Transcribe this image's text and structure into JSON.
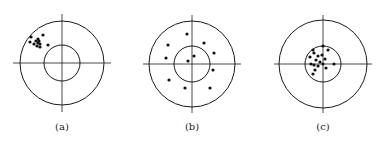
{
  "figure": {
    "stroke_color": "#1a1a1a",
    "dot_color": "#111111",
    "panels": [
      {
        "label": "(a)",
        "center": [
          62,
          63
        ],
        "outer_radius": 42,
        "inner_radius": 18,
        "cross_extent": 49,
        "dots": [
          [
            31,
            37
          ],
          [
            43,
            35
          ],
          [
            30,
            42
          ],
          [
            36,
            41
          ],
          [
            38,
            43
          ],
          [
            40,
            44
          ],
          [
            38,
            39
          ],
          [
            40,
            47
          ],
          [
            48,
            45
          ],
          [
            34,
            44
          ],
          [
            37,
            46
          ],
          [
            39,
            41
          ]
        ]
      },
      {
        "label": "(b)",
        "center": [
          192,
          64
        ],
        "outer_radius": 43,
        "inner_radius": 18,
        "cross_extent": 49,
        "dots": [
          [
            187,
            34
          ],
          [
            168,
            45
          ],
          [
            204,
            43
          ],
          [
            166,
            58
          ],
          [
            214,
            53
          ],
          [
            194,
            56
          ],
          [
            188,
            61
          ],
          [
            213,
            70
          ],
          [
            169,
            80
          ],
          [
            185,
            88
          ],
          [
            210,
            88
          ]
        ]
      },
      {
        "label": "(c)",
        "center": [
          323,
          64
        ],
        "outer_radius": 44,
        "inner_radius": 18,
        "cross_extent": 49,
        "dots": [
          [
            323,
            46
          ],
          [
            328,
            50
          ],
          [
            313,
            50
          ],
          [
            314,
            53
          ],
          [
            318,
            56
          ],
          [
            322,
            55
          ],
          [
            325,
            59
          ],
          [
            310,
            57
          ],
          [
            316,
            60
          ],
          [
            320,
            62
          ],
          [
            311,
            64
          ],
          [
            314,
            65
          ],
          [
            318,
            66
          ],
          [
            323,
            64
          ],
          [
            334,
            64
          ],
          [
            326,
            68
          ],
          [
            315,
            70
          ],
          [
            313,
            74
          ]
        ]
      }
    ]
  }
}
